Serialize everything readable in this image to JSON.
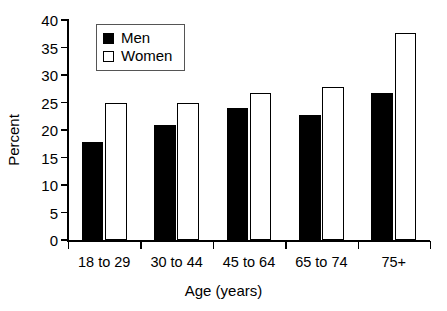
{
  "chart_data": {
    "type": "bar",
    "title": "",
    "xlabel": "Age (years)",
    "ylabel": "Percent",
    "categories": [
      "18 to 29",
      "30 to 44",
      "45 to 64",
      "65 to 74",
      "75+"
    ],
    "series": [
      {
        "name": "Men",
        "values": [
          17.8,
          21.0,
          24.0,
          22.8,
          26.7
        ],
        "color": "#000000",
        "style": "filled"
      },
      {
        "name": "Women",
        "values": [
          25.0,
          25.0,
          26.8,
          27.8,
          37.6
        ],
        "color": "#ffffff",
        "style": "outlined"
      }
    ],
    "ylim": [
      0,
      40
    ],
    "ytick_values": [
      0,
      5,
      10,
      15,
      20,
      25,
      30,
      35,
      40
    ],
    "ytick_labels": [
      "0",
      "5",
      "10",
      "15",
      "20",
      "25",
      "30",
      "35",
      "40"
    ],
    "grid": false,
    "legend": {
      "position": "top-left-inside",
      "entries": [
        {
          "label": "Men",
          "swatch": "filled-black-square"
        },
        {
          "label": "Women",
          "swatch": "open-white-square"
        }
      ]
    }
  }
}
